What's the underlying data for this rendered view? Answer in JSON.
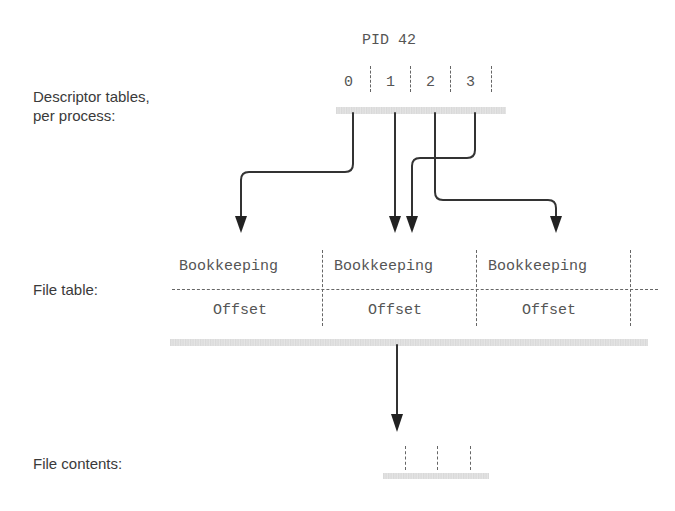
{
  "labels": {
    "descriptor_tables": [
      "Descriptor tables,",
      "per process:"
    ],
    "file_table": "File table:",
    "file_contents": "File contents:"
  },
  "descriptor_table": {
    "title": "PID 42",
    "slots": [
      "0",
      "1",
      "2",
      "3"
    ]
  },
  "file_table": {
    "entries": [
      {
        "bookkeeping": "Bookkeeping",
        "offset": "Offset"
      },
      {
        "bookkeeping": "Bookkeeping",
        "offset": "Offset"
      },
      {
        "bookkeeping": "Bookkeeping",
        "offset": "Offset"
      }
    ]
  },
  "arrows": [
    {
      "from": "fd-0",
      "to": "file-entry-0"
    },
    {
      "from": "fd-1",
      "to": "file-entry-1"
    },
    {
      "from": "fd-3",
      "to": "file-entry-1"
    },
    {
      "from": "fd-2",
      "to": "file-entry-2"
    },
    {
      "from": "file-entry-1",
      "to": "file-contents"
    }
  ],
  "colors": {
    "line": "#333333",
    "text": "#555555",
    "shadow": "#dcdcdc"
  }
}
